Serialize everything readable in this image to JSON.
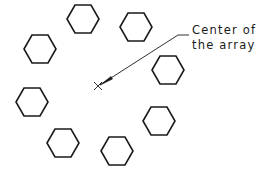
{
  "diagram": {
    "annotation": {
      "line1": "Center of",
      "line2": "the array"
    },
    "center_point": {
      "x": 98,
      "y": 86,
      "marker": "x-mark"
    },
    "hexagons": [
      {
        "id": 1,
        "cx": 83,
        "cy": 19
      },
      {
        "id": 2,
        "cx": 136,
        "cy": 27
      },
      {
        "id": 3,
        "cx": 168,
        "cy": 70
      },
      {
        "id": 4,
        "cx": 159,
        "cy": 121
      },
      {
        "id": 5,
        "cx": 117,
        "cy": 151
      },
      {
        "id": 6,
        "cx": 63,
        "cy": 143
      },
      {
        "id": 7,
        "cx": 32,
        "cy": 102
      },
      {
        "id": 8,
        "cx": 40,
        "cy": 49
      }
    ],
    "hexagon_size": {
      "half_width": 16,
      "half_height": 14
    },
    "colors": {
      "stroke": "#1a1a1a",
      "background": "#ffffff"
    }
  }
}
